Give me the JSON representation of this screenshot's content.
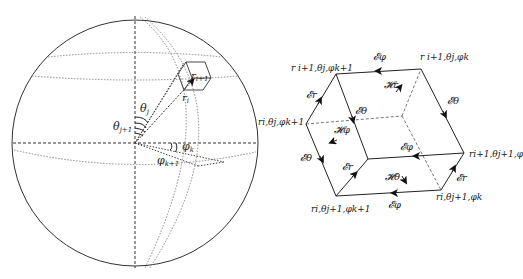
{
  "sphere": {
    "labels": {
      "r_i1": "r",
      "r_i1_sub": "i+1",
      "r_i": "r",
      "r_i_sub": "i",
      "theta_j": "θ",
      "theta_j_sub": "j",
      "theta_j1": "θ",
      "theta_j1_sub": "j+1",
      "phi_k": "φ",
      "phi_k_sub": "k",
      "phi_k1": "φ",
      "phi_k1_sub": "k+1"
    }
  },
  "cube": {
    "vertices": {
      "top_left": "r",
      "top_left_rest": "i+1,θj,φk+1",
      "top_right": "r",
      "top_right_rest": "i+1,θj,φk",
      "mid_left": "ri,θj,φk+1",
      "right": "ri+1,θj+1,φ",
      "bottom_left": "ri,θj+1,φk+1",
      "bottom_right": "ri,θj+1,φk"
    },
    "edges": {
      "e_phi_top": "𝓔φ",
      "e_r_left": "𝓔r",
      "e_theta_left": "𝓔θ",
      "e_theta_inner": "𝓔θ",
      "e_theta_right": "𝓔θ",
      "e_phi_mid": "𝓔φ",
      "e_r_inner": "𝓔r",
      "e_r_right": "𝓔r",
      "e_phi_bottom": "𝓔φ"
    },
    "fields": {
      "h_r": "𝓗r",
      "h_phi": "𝓗φ",
      "h_theta": "𝓗θ"
    }
  }
}
